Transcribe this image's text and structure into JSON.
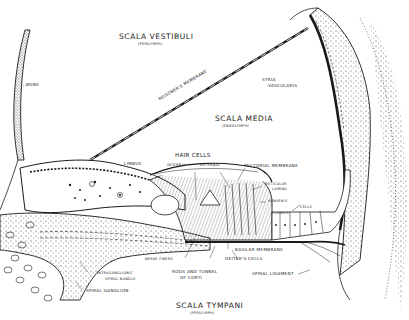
{
  "diagram": {
    "style": "black ink line drawing on white",
    "colors": {
      "ink": "#1a1a1a",
      "background": "#ffffff"
    },
    "regions": {
      "scala_vestibuli": {
        "label": "SCALA VESTIBULI",
        "sub": "(PERILYMPH)"
      },
      "scala_media": {
        "label": "SCALA MEDIA",
        "sub": "(ENDOLYMPH)"
      },
      "scala_tympani": {
        "label": "SCALA TYMPANI",
        "sub": "(PERILYMPH)"
      }
    },
    "labels": {
      "bone": "BONE",
      "reissners_membrane": "REISSNER'S MEMBRANE",
      "stria_line1": "STRIA",
      "stria_line2": "VASCULARIS",
      "limbus": "LIMBUS",
      "hair_cells": "HAIR CELLS",
      "internal": "INTERNAL",
      "external": "EXTERNAL",
      "tectorial_membrane": "TECTORIAL MEMBRANE",
      "reticular_line1": "RETICULAR",
      "reticular_line2": "LAMINA",
      "hensens": "HENSEN'S",
      "cells": "CELLS",
      "claudius": "CLAUDIUS'",
      "nerve_fibers": "NERVE FIBERS",
      "basilar_membrane": "BASILAR MEMBRANE",
      "deiters_cells": "DEITER'S CELLS",
      "rods_line1": "RODS AND TUNNEL",
      "rods_line2": "OF CORTI",
      "spiral_ligament": "SPIRAL LIGAMENT",
      "intraganglionic_line1": "INTRAGANGLIONIC",
      "intraganglionic_line2": "SPIRAL BUNDLE",
      "spiral_ganglion": "SPIRAL GANGLION"
    }
  }
}
